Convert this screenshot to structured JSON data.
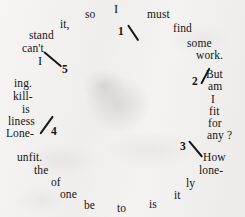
{
  "document": {
    "kind": "circular-text-puzzle",
    "medium": "aged paper scan",
    "background_color": "#f1f0ee",
    "ink_color": "#141414",
    "reading_note": "Words are arranged in a ring read clockwise with numbered break marks 1 through 5."
  },
  "words": [
    {
      "text": "so",
      "x": 85,
      "y": 9,
      "size": "normal"
    },
    {
      "text": "I",
      "x": 114,
      "y": 3,
      "size": "big"
    },
    {
      "text": "must",
      "x": 147,
      "y": 9,
      "size": "normal"
    },
    {
      "text": "it,",
      "x": 60,
      "y": 19,
      "size": "normal"
    },
    {
      "text": "find",
      "x": 173,
      "y": 23,
      "size": "normal"
    },
    {
      "text": "stand",
      "x": 29,
      "y": 30,
      "size": "normal"
    },
    {
      "text": "some",
      "x": 187,
      "y": 38,
      "size": "normal"
    },
    {
      "text": "can't",
      "x": 22,
      "y": 43,
      "size": "normal"
    },
    {
      "text": "work.",
      "x": 196,
      "y": 50,
      "size": "normal"
    },
    {
      "text": "I",
      "x": 38,
      "y": 55,
      "size": "big"
    },
    {
      "text": "But",
      "x": 206,
      "y": 69,
      "size": "normal"
    },
    {
      "text": "am",
      "x": 208,
      "y": 81,
      "size": "normal"
    },
    {
      "text": "ing.",
      "x": 14,
      "y": 78,
      "size": "normal"
    },
    {
      "text": "I",
      "x": 211,
      "y": 94,
      "size": "normal"
    },
    {
      "text": "kill-",
      "x": 13,
      "y": 91,
      "size": "normal"
    },
    {
      "text": "fit",
      "x": 209,
      "y": 106,
      "size": "normal"
    },
    {
      "text": "is",
      "x": 22,
      "y": 104,
      "size": "normal"
    },
    {
      "text": "for",
      "x": 208,
      "y": 118,
      "size": "normal"
    },
    {
      "text": "liness",
      "x": 8,
      "y": 116,
      "size": "normal"
    },
    {
      "text": "any ?",
      "x": 207,
      "y": 130,
      "size": "normal"
    },
    {
      "text": "Lone-",
      "x": 6,
      "y": 128,
      "size": "normal"
    },
    {
      "text": "How",
      "x": 203,
      "y": 152,
      "size": "normal"
    },
    {
      "text": "unfit.",
      "x": 17,
      "y": 152,
      "size": "normal"
    },
    {
      "text": "lone-",
      "x": 199,
      "y": 165,
      "size": "normal"
    },
    {
      "text": "the",
      "x": 34,
      "y": 165,
      "size": "normal"
    },
    {
      "text": "ly",
      "x": 186,
      "y": 178,
      "size": "normal"
    },
    {
      "text": "of",
      "x": 51,
      "y": 177,
      "size": "normal"
    },
    {
      "text": "it",
      "x": 174,
      "y": 190,
      "size": "normal"
    },
    {
      "text": "one",
      "x": 60,
      "y": 189,
      "size": "normal"
    },
    {
      "text": "is",
      "x": 149,
      "y": 199,
      "size": "normal"
    },
    {
      "text": "be",
      "x": 84,
      "y": 200,
      "size": "normal"
    },
    {
      "text": "to",
      "x": 117,
      "y": 203,
      "size": "normal"
    }
  ],
  "numerals": [
    {
      "label": "1",
      "x": 118,
      "y": 26
    },
    {
      "label": "2",
      "x": 192,
      "y": 76
    },
    {
      "label": "3",
      "x": 180,
      "y": 141
    },
    {
      "label": "4",
      "x": 51,
      "y": 126
    },
    {
      "label": "5",
      "x": 62,
      "y": 64
    }
  ],
  "strokes": [
    {
      "name": "stroke-1",
      "x": 128,
      "y": 24,
      "length": 19,
      "angle": 56,
      "thickness": 1.6
    },
    {
      "name": "stroke-2",
      "x": 201,
      "y": 83,
      "length": 18,
      "angle": -62,
      "thickness": 1.6
    },
    {
      "name": "stroke-3",
      "x": 189,
      "y": 140,
      "length": 21,
      "angle": 50,
      "thickness": 1.6
    },
    {
      "name": "stroke-4",
      "x": 40,
      "y": 133,
      "length": 22,
      "angle": -54,
      "thickness": 1.6
    },
    {
      "name": "stroke-5",
      "x": 44,
      "y": 51,
      "length": 23,
      "angle": 40,
      "thickness": 1.6
    }
  ]
}
